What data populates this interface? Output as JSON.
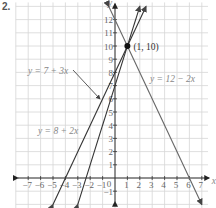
{
  "problem_number": "2.",
  "chart_data": {
    "type": "line",
    "title": "",
    "xlabel": "x",
    "ylabel": "y",
    "xlim": [
      -8,
      8
    ],
    "ylim": [
      -2,
      13
    ],
    "grid": true,
    "x_ticks": [
      "-7",
      "-6",
      "-5",
      "-4",
      "-3",
      "-2",
      "-1",
      "0",
      "1",
      "2",
      "3",
      "4",
      "5",
      "6",
      "7"
    ],
    "y_ticks": [
      "-1",
      "1",
      "2",
      "3",
      "4",
      "5",
      "6",
      "7",
      "8",
      "9",
      "10",
      "11",
      "12"
    ],
    "series": [
      {
        "name": "y = 7 + 3x",
        "slope": 3,
        "intercept": 7,
        "x": [
          -3,
          2
        ],
        "y": [
          -2,
          13
        ]
      },
      {
        "name": "y = 8 + 2x",
        "slope": 2,
        "intercept": 8,
        "x": [
          -5,
          2.5
        ],
        "y": [
          -2,
          13
        ]
      },
      {
        "name": "y = 12 − 2x",
        "slope": -2,
        "intercept": 12,
        "x": [
          -0.5,
          7
        ],
        "y": [
          13,
          -2
        ]
      }
    ],
    "annotations": [
      {
        "text": "(1, 10)",
        "x": 1,
        "y": 10,
        "type": "intersection-point"
      },
      {
        "text": "y = 7 + 3x",
        "type": "label-with-arrow"
      },
      {
        "text": "y = 8 + 2x",
        "type": "label"
      },
      {
        "text": "y = 12 − 2x",
        "type": "label"
      }
    ]
  },
  "labels": {
    "eq1": "y = 7 + 3x",
    "eq2": "y = 8 + 2x",
    "eq3": "y = 12 − 2x",
    "point": "(1, 10)",
    "x_axis": "x",
    "y_axis": "y"
  }
}
